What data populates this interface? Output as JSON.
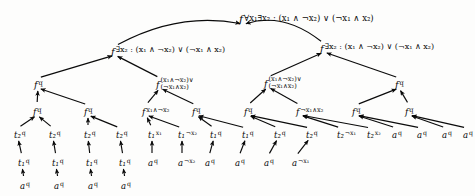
{
  "figure": {
    "kind": "computation-tree",
    "colors": {
      "ink": "#0a0a0a",
      "background": "#fdfdfc"
    }
  },
  "nodes": [
    {
      "id": "root",
      "symbol": "f",
      "label": "∀x₁∃x₂ : (x₁ ∧ ¬x₂) ∨ (¬x₁ ∧ x₂)",
      "x": 243,
      "y": 18,
      "tier": "t-root",
      "anchor": "right"
    },
    {
      "id": "n-L",
      "symbol": "f",
      "label": "∃x₂ : (x₁ ∧ ¬x₂) ∨ (¬x₁ ∧ x₂)",
      "x": 115,
      "y": 50,
      "tier": "t-l2",
      "anchor": "right"
    },
    {
      "id": "n-R",
      "symbol": "f",
      "label": "∃x₂ : (x₁ ∧ ¬x₂) ∨ (¬x₁ ∧ x₂)",
      "x": 324,
      "y": 47,
      "tier": "t-l2",
      "anchor": "right"
    },
    {
      "id": "n-LL",
      "symbol": "f",
      "label": "q",
      "x": 38,
      "y": 83,
      "tier": "t-l3",
      "anchor": "right"
    },
    {
      "id": "n-LR",
      "symbol": "f",
      "label": "(x₁∧¬x₂)∨|(¬x₁∧x₂)",
      "x": 160,
      "y": 83,
      "tier": "t-l3",
      "anchor": "stack"
    },
    {
      "id": "n-RL",
      "symbol": "f",
      "label": "(x₁∧¬x₂)∨|(¬x₁∧x₂)",
      "x": 268,
      "y": 82,
      "tier": "t-l3",
      "anchor": "stack"
    },
    {
      "id": "n-RR",
      "symbol": "f",
      "label": "q",
      "x": 399,
      "y": 83,
      "tier": "t-l3",
      "anchor": "right"
    },
    {
      "id": "n-LLL",
      "symbol": "f",
      "label": "q",
      "x": 37,
      "y": 110,
      "tier": "t-l4",
      "anchor": "right"
    },
    {
      "id": "n-LLR",
      "symbol": "f",
      "label": "q",
      "x": 88,
      "y": 110,
      "tier": "t-l4",
      "anchor": "right"
    },
    {
      "id": "n-LRL",
      "symbol": "f",
      "label": "x₁∧¬x₂",
      "x": 146,
      "y": 110,
      "tier": "t-l4",
      "anchor": "right"
    },
    {
      "id": "n-LRR",
      "symbol": "f",
      "label": "q",
      "x": 196,
      "y": 110,
      "tier": "t-l4",
      "anchor": "right"
    },
    {
      "id": "n-RLL",
      "symbol": "f",
      "label": "q",
      "x": 248,
      "y": 110,
      "tier": "t-l4",
      "anchor": "right"
    },
    {
      "id": "n-RLR",
      "symbol": "f",
      "label": "¬x₁∧x₂",
      "x": 300,
      "y": 110,
      "tier": "t-l4",
      "anchor": "right"
    },
    {
      "id": "n-RRL",
      "symbol": "f",
      "label": "q",
      "x": 356,
      "y": 110,
      "tier": "t-l4",
      "anchor": "right"
    },
    {
      "id": "n-RRR",
      "symbol": "f",
      "label": "q",
      "x": 409,
      "y": 110,
      "tier": "t-l4",
      "anchor": "right"
    },
    {
      "id": "l1",
      "symbol": "t₂",
      "label": "q",
      "x": 18,
      "y": 133,
      "tier": "t-leaf",
      "anchor": "right"
    },
    {
      "id": "l2",
      "symbol": "t₂",
      "label": "q",
      "x": 53,
      "y": 133,
      "tier": "t-leaf",
      "anchor": "right"
    },
    {
      "id": "l3",
      "symbol": "t₂",
      "label": "q",
      "x": 88,
      "y": 133,
      "tier": "t-leaf",
      "anchor": "right"
    },
    {
      "id": "l4",
      "symbol": "t₂",
      "label": "q",
      "x": 120,
      "y": 133,
      "tier": "t-leaf",
      "anchor": "right"
    },
    {
      "id": "l5",
      "symbol": "t₁",
      "label": "x₁",
      "x": 152,
      "y": 133,
      "tier": "t-leaf",
      "anchor": "right"
    },
    {
      "id": "l6",
      "symbol": "t₁",
      "label": "¬x₂",
      "x": 182,
      "y": 133,
      "tier": "t-leaf",
      "anchor": "right"
    },
    {
      "id": "l7",
      "symbol": "t₁",
      "label": "q",
      "x": 214,
      "y": 133,
      "tier": "t-leaf",
      "anchor": "right"
    },
    {
      "id": "l8",
      "symbol": "t₁",
      "label": "q",
      "x": 246,
      "y": 133,
      "tier": "t-leaf",
      "anchor": "right"
    },
    {
      "id": "l9",
      "symbol": "t₂",
      "label": "q",
      "x": 278,
      "y": 133,
      "tier": "t-leaf",
      "anchor": "right"
    },
    {
      "id": "l10",
      "symbol": "t₂",
      "label": "q",
      "x": 310,
      "y": 133,
      "tier": "t-leaf",
      "anchor": "right"
    },
    {
      "id": "l11",
      "symbol": "t₂",
      "label": "¬x₁",
      "x": 341,
      "y": 133,
      "tier": "t-leaf",
      "anchor": "right"
    },
    {
      "id": "l12",
      "symbol": "t₂",
      "label": "x₂",
      "x": 371,
      "y": 133,
      "tier": "t-leaf",
      "anchor": "right"
    },
    {
      "id": "l13",
      "symbol": "a",
      "label": "q",
      "x": 396,
      "y": 133,
      "tier": "t-leaf",
      "anchor": "right"
    },
    {
      "id": "l14",
      "symbol": "a",
      "label": "q",
      "x": 421,
      "y": 133,
      "tier": "t-leaf",
      "anchor": "right"
    },
    {
      "id": "l15",
      "symbol": "a",
      "label": "q",
      "x": 446,
      "y": 133,
      "tier": "t-leaf",
      "anchor": "right"
    },
    {
      "id": "l16",
      "symbol": "a",
      "label": "q",
      "x": 467,
      "y": 133,
      "tier": "t-leaf",
      "anchor": "right"
    },
    {
      "id": "m1",
      "symbol": "t₁",
      "label": "q",
      "x": 22,
      "y": 161,
      "tier": "t-leaf",
      "anchor": "right"
    },
    {
      "id": "m2",
      "symbol": "t₁",
      "label": "q",
      "x": 56,
      "y": 161,
      "tier": "t-leaf",
      "anchor": "right"
    },
    {
      "id": "m3",
      "symbol": "t₁",
      "label": "q",
      "x": 90,
      "y": 161,
      "tier": "t-leaf",
      "anchor": "right"
    },
    {
      "id": "m4",
      "symbol": "t₁",
      "label": "q",
      "x": 123,
      "y": 161,
      "tier": "t-leaf",
      "anchor": "right"
    },
    {
      "id": "m5",
      "symbol": "a",
      "label": "q",
      "x": 152,
      "y": 161,
      "tier": "t-leaf",
      "anchor": "right"
    },
    {
      "id": "m6",
      "symbol": "a",
      "label": "¬x₂",
      "x": 182,
      "y": 161,
      "tier": "t-leaf",
      "anchor": "right"
    },
    {
      "id": "m7",
      "symbol": "a",
      "label": "q",
      "x": 209,
      "y": 161,
      "tier": "t-leaf",
      "anchor": "right"
    },
    {
      "id": "m8",
      "symbol": "a",
      "label": "q",
      "x": 239,
      "y": 161,
      "tier": "t-leaf",
      "anchor": "right"
    },
    {
      "id": "m9",
      "symbol": "a",
      "label": "q",
      "x": 268,
      "y": 161,
      "tier": "t-leaf",
      "anchor": "right"
    },
    {
      "id": "m10",
      "symbol": "a",
      "label": "¬x₁",
      "x": 296,
      "y": 161,
      "tier": "t-leaf",
      "anchor": "right"
    },
    {
      "id": "b1",
      "symbol": "a",
      "label": "q",
      "x": 24,
      "y": 184,
      "tier": "t-leaf",
      "anchor": "right"
    },
    {
      "id": "b2",
      "symbol": "a",
      "label": "q",
      "x": 58,
      "y": 184,
      "tier": "t-leaf",
      "anchor": "right"
    },
    {
      "id": "b3",
      "symbol": "a",
      "label": "q",
      "x": 92,
      "y": 184,
      "tier": "t-leaf",
      "anchor": "right"
    },
    {
      "id": "b4",
      "symbol": "a",
      "label": "q",
      "x": 125,
      "y": 184,
      "tier": "t-leaf",
      "anchor": "right"
    }
  ],
  "edges": [
    {
      "from": "n-L",
      "to": "root"
    },
    {
      "from": "n-R",
      "to": "root"
    },
    {
      "from": "n-LL",
      "to": "n-L"
    },
    {
      "from": "n-LR",
      "to": "n-L"
    },
    {
      "from": "n-RL",
      "to": "n-R"
    },
    {
      "from": "n-RR",
      "to": "n-R"
    },
    {
      "from": "n-LLL",
      "to": "n-LL"
    },
    {
      "from": "n-LLR",
      "to": "n-LL"
    },
    {
      "from": "n-LRL",
      "to": "n-LR"
    },
    {
      "from": "n-LRR",
      "to": "n-LR"
    },
    {
      "from": "n-RLL",
      "to": "n-RL"
    },
    {
      "from": "n-RLR",
      "to": "n-RL"
    },
    {
      "from": "n-RRL",
      "to": "n-RR"
    },
    {
      "from": "n-RRR",
      "to": "n-RR"
    },
    {
      "from": "l1",
      "to": "n-LLL"
    },
    {
      "from": "l2",
      "to": "n-LLL"
    },
    {
      "from": "l3",
      "to": "n-LLR"
    },
    {
      "from": "l4",
      "to": "n-LLR"
    },
    {
      "from": "l5",
      "to": "n-LRL"
    },
    {
      "from": "l6",
      "to": "n-LRL"
    },
    {
      "from": "l7",
      "to": "n-LRR"
    },
    {
      "from": "l8",
      "to": "n-LRR"
    },
    {
      "from": "l9",
      "to": "n-RLL"
    },
    {
      "from": "l10",
      "to": "n-RLL"
    },
    {
      "from": "l11",
      "to": "n-RLR"
    },
    {
      "from": "l12",
      "to": "n-RLR"
    },
    {
      "from": "l13",
      "to": "n-RRL"
    },
    {
      "from": "l14",
      "to": "n-RRL"
    },
    {
      "from": "l15",
      "to": "n-RRR"
    },
    {
      "from": "l16",
      "to": "n-RRR"
    },
    {
      "from": "m1",
      "to": "l1"
    },
    {
      "from": "m2",
      "to": "l2"
    },
    {
      "from": "m3",
      "to": "l3"
    },
    {
      "from": "m4",
      "to": "l4"
    },
    {
      "from": "m5",
      "to": "l5"
    },
    {
      "from": "m6",
      "to": "l6"
    },
    {
      "from": "m7",
      "to": "l7"
    },
    {
      "from": "m8",
      "to": "l8"
    },
    {
      "from": "m9",
      "to": "l9"
    },
    {
      "from": "m10",
      "to": "l10"
    },
    {
      "from": "b1",
      "to": "m1"
    },
    {
      "from": "b2",
      "to": "m2"
    },
    {
      "from": "b3",
      "to": "m3"
    },
    {
      "from": "b4",
      "to": "m4"
    }
  ]
}
